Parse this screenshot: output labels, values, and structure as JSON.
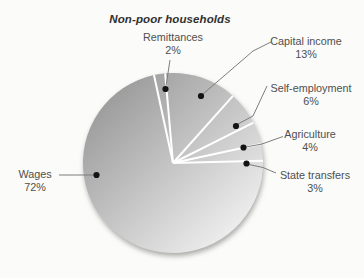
{
  "chart_data": {
    "type": "pie",
    "title": "Non-poor households",
    "legend": "none",
    "labels_style": "callout-with-dot",
    "rotation_deg": -5,
    "slices": [
      {
        "label": "Capital income",
        "value": 13,
        "pct_label": "13%"
      },
      {
        "label": "Self-employment",
        "value": 6,
        "pct_label": "6%"
      },
      {
        "label": "Agriculture",
        "value": 4,
        "pct_label": "4%"
      },
      {
        "label": "State transfers",
        "value": 3,
        "pct_label": "3%"
      },
      {
        "label": "Wages",
        "value": 72,
        "pct_label": "72%"
      },
      {
        "label": "Remittances",
        "value": 2,
        "pct_label": "2%"
      }
    ],
    "colors": {
      "gradient_start": "#969696",
      "gradient_end": "#f4f4f4",
      "separator": "#ffffff",
      "leader_line": "#7d7d7d",
      "dot": "#141414",
      "label_text": "#4f4f4f",
      "title_text": "#303030",
      "background": "#fbfbf9"
    }
  }
}
